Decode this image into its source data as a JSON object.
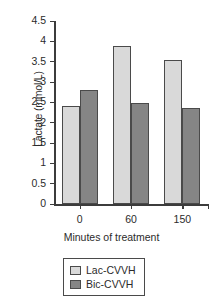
{
  "chart_data": {
    "type": "bar",
    "title": "",
    "subtitle": "",
    "xlabel": "Minutes of treatment",
    "ylabel": "Lactate (mmol/L)",
    "categories": [
      "0",
      "60",
      "150"
    ],
    "series": [
      {
        "name": "Lac-CVVH",
        "values": [
          2.4,
          3.88,
          3.54
        ],
        "color": "#d9d9d9"
      },
      {
        "name": "Bic-CVVH",
        "values": [
          2.8,
          2.48,
          2.36
        ],
        "color": "#858585"
      }
    ],
    "ylim": [
      0,
      4.5
    ],
    "yticks": [
      "0",
      "0.5",
      "1",
      "1.5",
      "2",
      "2.5",
      "3",
      "3.5",
      "4",
      "4.5"
    ],
    "ytick_values": [
      0,
      0.5,
      1,
      1.5,
      2,
      2.5,
      3,
      3.5,
      4,
      4.5
    ],
    "grid": false,
    "legend_position": "bottom",
    "legend_entries": [
      {
        "label": "Lac-CVVH",
        "color": "#d9d9d9"
      },
      {
        "label": "Bic-CVVH",
        "color": "#858585"
      }
    ],
    "axis_color": "#3c3c3c",
    "bar_edge_color": "#4a4a4a",
    "background": "#ffffff"
  }
}
